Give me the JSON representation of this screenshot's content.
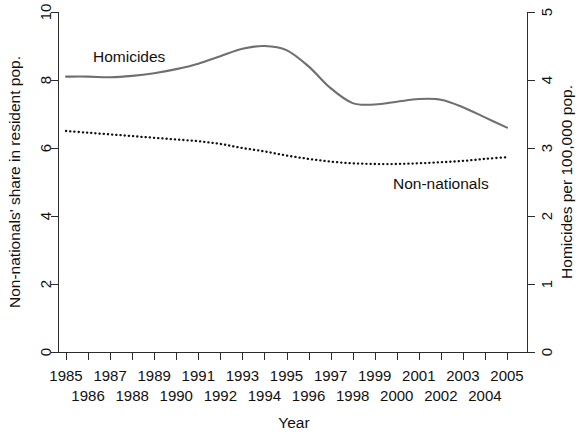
{
  "chart_data": {
    "type": "line",
    "title": "",
    "xlabel": "Year",
    "ylabel": "Non-nationals' share in resident pop.",
    "y2label": "Homicides per 100,000 pop.",
    "grid": false,
    "legend": "inline-labels",
    "xlim": [
      1985,
      2005
    ],
    "ylim": [
      0,
      10
    ],
    "y2lim": [
      0,
      5
    ],
    "x": [
      1985,
      1986,
      1987,
      1988,
      1989,
      1990,
      1991,
      1992,
      1993,
      1994,
      1995,
      1996,
      1997,
      1998,
      1999,
      2000,
      2001,
      2002,
      2003,
      2004,
      2005
    ],
    "xticklabels_top": [
      "1985",
      "1987",
      "1989",
      "1991",
      "1993",
      "1995",
      "1997",
      "1999",
      "2001",
      "2003",
      "2005"
    ],
    "xticklabels_bottom": [
      "1986",
      "1988",
      "1990",
      "1992",
      "1994",
      "1996",
      "1998",
      "2000",
      "2002",
      "2004"
    ],
    "yticklabels": [
      "0",
      "2",
      "4",
      "6",
      "8",
      "10"
    ],
    "yticks": [
      0,
      2,
      4,
      6,
      8,
      10
    ],
    "y2ticklabels": [
      "0",
      "1",
      "2",
      "3",
      "4",
      "5"
    ],
    "y2ticks": [
      0,
      1,
      2,
      3,
      4,
      5
    ],
    "series": [
      {
        "name": "Homicides",
        "axis": "right",
        "style": "solid",
        "color": "#6f6f6f",
        "label_text": "Homicides",
        "values": [
          4.05,
          4.05,
          4.04,
          4.06,
          4.1,
          4.16,
          4.24,
          4.35,
          4.46,
          4.5,
          4.44,
          4.2,
          3.88,
          3.66,
          3.64,
          3.68,
          3.72,
          3.71,
          3.6,
          3.45,
          3.3
        ],
        "values_left_scale": [
          8.1,
          8.1,
          8.08,
          8.12,
          8.2,
          8.32,
          8.48,
          8.7,
          8.92,
          9.0,
          8.88,
          8.4,
          7.76,
          7.32,
          7.28,
          7.36,
          7.44,
          7.42,
          7.2,
          6.9,
          6.6
        ]
      },
      {
        "name": "Non-nationals",
        "axis": "left",
        "style": "dotted",
        "color": "#111111",
        "label_text": "Non-nationals",
        "values": [
          6.5,
          6.45,
          6.4,
          6.35,
          6.3,
          6.25,
          6.2,
          6.12,
          6.0,
          5.9,
          5.78,
          5.68,
          5.6,
          5.55,
          5.53,
          5.53,
          5.55,
          5.58,
          5.62,
          5.68,
          5.73
        ]
      }
    ]
  },
  "labels": {
    "left_axis_title": "Non-nationals' share in resident pop.",
    "right_axis_title": "Homicides per 100,000 pop.",
    "x_axis_title": "Year",
    "series_homicides": "Homicides",
    "series_nonnationals": "Non-nationals"
  }
}
